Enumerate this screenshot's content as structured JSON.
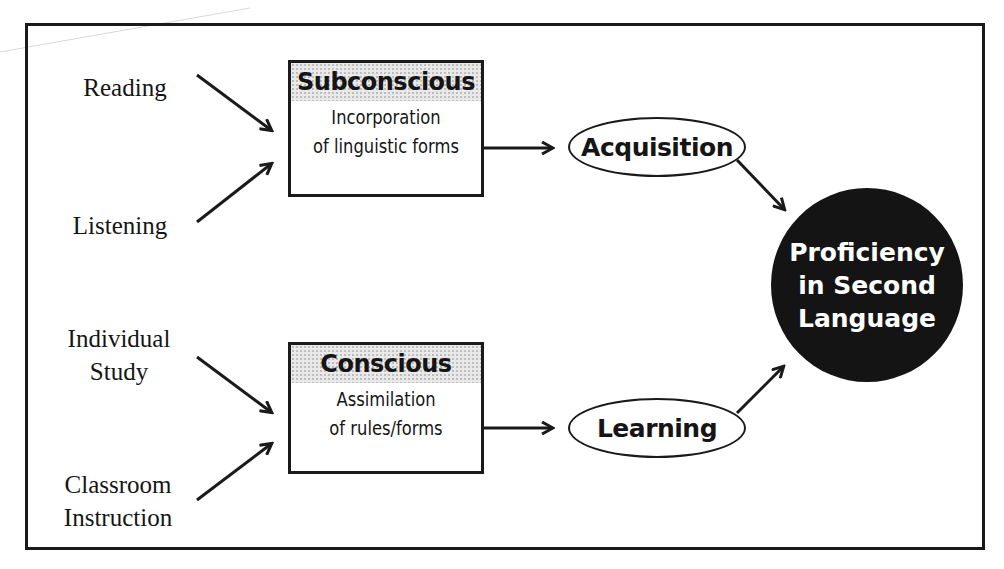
{
  "diagram": {
    "inputs": {
      "top": [
        {
          "label": "Reading"
        },
        {
          "label": "Listening"
        }
      ],
      "bottom": [
        {
          "label": "Individual\nStudy"
        },
        {
          "label": "Classroom\nInstruction"
        }
      ]
    },
    "processes": [
      {
        "title": "Subconscious",
        "description": "Incorporation\nof linguistic forms"
      },
      {
        "title": "Conscious",
        "description": "Assimilation\nof rules/forms"
      }
    ],
    "outcomes": [
      {
        "label": "Acquisition"
      },
      {
        "label": "Learning"
      }
    ],
    "goal": {
      "label": "Proficiency\nin Second\nLanguage"
    },
    "colors": {
      "line": "#1a1a1a",
      "goal_fill": "#141414",
      "goal_text": "#ffffff",
      "header_fill": "#e9e9e9"
    },
    "edges": [
      {
        "from": "Reading",
        "to": "Subconscious"
      },
      {
        "from": "Listening",
        "to": "Subconscious"
      },
      {
        "from": "Subconscious",
        "to": "Acquisition"
      },
      {
        "from": "Acquisition",
        "to": "Proficiency in Second Language"
      },
      {
        "from": "Individual Study",
        "to": "Conscious"
      },
      {
        "from": "Classroom Instruction",
        "to": "Conscious"
      },
      {
        "from": "Conscious",
        "to": "Learning"
      },
      {
        "from": "Learning",
        "to": "Proficiency in Second Language"
      }
    ]
  }
}
